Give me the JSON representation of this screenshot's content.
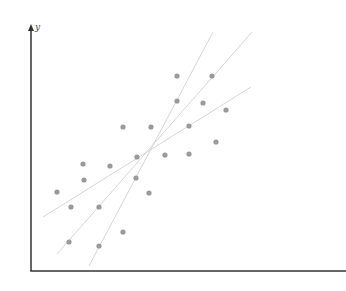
{
  "chart_data": {
    "type": "scatter",
    "title": "",
    "xlabel": "",
    "ylabel": "y",
    "grid": false,
    "legend": null,
    "axis_color": "#333333",
    "point_color": "#9a9a9a",
    "line_color": "#d6d6d6",
    "points_px": [
      [
        177,
        76
      ],
      [
        212,
        76
      ],
      [
        177,
        101
      ],
      [
        203,
        103
      ],
      [
        226,
        110
      ],
      [
        123,
        127
      ],
      [
        151,
        127
      ],
      [
        189,
        126
      ],
      [
        216,
        142
      ],
      [
        137,
        157
      ],
      [
        165,
        155
      ],
      [
        189,
        154
      ],
      [
        83,
        164
      ],
      [
        110,
        166
      ],
      [
        84,
        180
      ],
      [
        136,
        178
      ],
      [
        57,
        192
      ],
      [
        149,
        193
      ],
      [
        71,
        207
      ],
      [
        99,
        207
      ],
      [
        123,
        232
      ],
      [
        69,
        242
      ],
      [
        99,
        246
      ]
    ],
    "lines_px": [
      {
        "name": "steep-fit-line",
        "x1": 89,
        "y1": 266,
        "x2": 213,
        "y2": 32
      },
      {
        "name": "middle-fit-line",
        "x1": 57,
        "y1": 254,
        "x2": 252,
        "y2": 32
      },
      {
        "name": "shallow-fit-line",
        "x1": 43,
        "y1": 217,
        "x2": 251,
        "y2": 87
      }
    ],
    "axes_px": {
      "origin": [
        31,
        271
      ],
      "y_top": 24,
      "x_right": 346
    }
  }
}
